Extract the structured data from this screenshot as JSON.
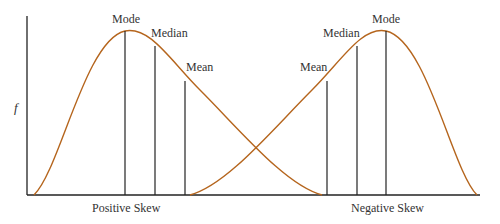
{
  "figure": {
    "y_axis_label": "f",
    "colors": {
      "curve": "#b5651d",
      "axes": "#222222",
      "text": "#333333"
    },
    "left_panel": {
      "caption": "Positive Skew",
      "markers": [
        {
          "label": "Mode",
          "x": 125,
          "y": 31
        },
        {
          "label": "Median",
          "x": 155,
          "y": 46
        },
        {
          "label": "Mean",
          "x": 185,
          "y": 81
        }
      ]
    },
    "right_panel": {
      "caption": "Negative Skew",
      "markers": [
        {
          "label": "Mean",
          "x": 327,
          "y": 81
        },
        {
          "label": "Median",
          "x": 357,
          "y": 46
        },
        {
          "label": "Mode",
          "x": 386,
          "y": 31
        }
      ]
    }
  }
}
